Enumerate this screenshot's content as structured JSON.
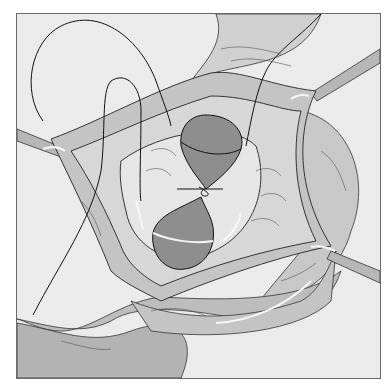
{
  "figure": {
    "type": "medical-illustration",
    "style": "grayscale line drawing",
    "colors": {
      "background": "#ebebeb",
      "tissue_light": "#d6d6d6",
      "tissue_mid": "#b9b9b9",
      "tissue_dark": "#9c9c9c",
      "organ": "#8c8c8c",
      "line": "#1a1a1a",
      "highlight": "#f7f7f7"
    }
  }
}
